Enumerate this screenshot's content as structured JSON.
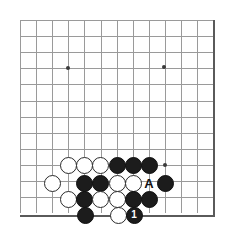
{
  "figure": {
    "kind": "go-board-diagram",
    "width": 225,
    "height": 227,
    "background_color": "#ffffff"
  },
  "board": {
    "line_color": "#9a9a9a",
    "edge_color": "#5a5a5a",
    "star_color": "#3a3a3a",
    "origin_x": 20,
    "origin_y": 20,
    "spacing": 16.1,
    "columns": 13,
    "rows": 13,
    "right_edge_x": 213,
    "bottom_edge_y": 215,
    "star_points": [
      {
        "x": 68,
        "y": 68
      },
      {
        "x": 164,
        "y": 67
      },
      {
        "x": 165,
        "y": 165
      }
    ]
  },
  "stones": [
    {
      "color": "white",
      "x": 68,
      "y": 165,
      "label": ""
    },
    {
      "color": "white",
      "x": 84,
      "y": 165,
      "label": ""
    },
    {
      "color": "white",
      "x": 100,
      "y": 165,
      "label": ""
    },
    {
      "color": "black",
      "x": 117,
      "y": 165,
      "label": ""
    },
    {
      "color": "black",
      "x": 133,
      "y": 165,
      "label": ""
    },
    {
      "color": "black",
      "x": 149,
      "y": 165,
      "label": ""
    },
    {
      "color": "white",
      "x": 52,
      "y": 183,
      "label": ""
    },
    {
      "color": "black",
      "x": 84,
      "y": 183,
      "label": ""
    },
    {
      "color": "black",
      "x": 100,
      "y": 183,
      "label": ""
    },
    {
      "color": "white",
      "x": 117,
      "y": 183,
      "label": ""
    },
    {
      "color": "white",
      "x": 133,
      "y": 183,
      "label": ""
    },
    {
      "color": "black",
      "x": 165,
      "y": 183,
      "label": ""
    },
    {
      "color": "white",
      "x": 68,
      "y": 199,
      "label": ""
    },
    {
      "color": "black",
      "x": 84,
      "y": 199,
      "label": ""
    },
    {
      "color": "white",
      "x": 100,
      "y": 199,
      "label": ""
    },
    {
      "color": "white",
      "x": 117,
      "y": 199,
      "label": ""
    },
    {
      "color": "black",
      "x": 133,
      "y": 199,
      "label": ""
    },
    {
      "color": "black",
      "x": 149,
      "y": 199,
      "label": ""
    },
    {
      "color": "black",
      "x": 85,
      "y": 215,
      "label": ""
    },
    {
      "color": "white",
      "x": 118,
      "y": 215,
      "label": ""
    },
    {
      "color": "black",
      "x": 134,
      "y": 215,
      "label": "1"
    }
  ],
  "labels": [
    {
      "text": "A",
      "x": 149,
      "y": 183
    }
  ]
}
